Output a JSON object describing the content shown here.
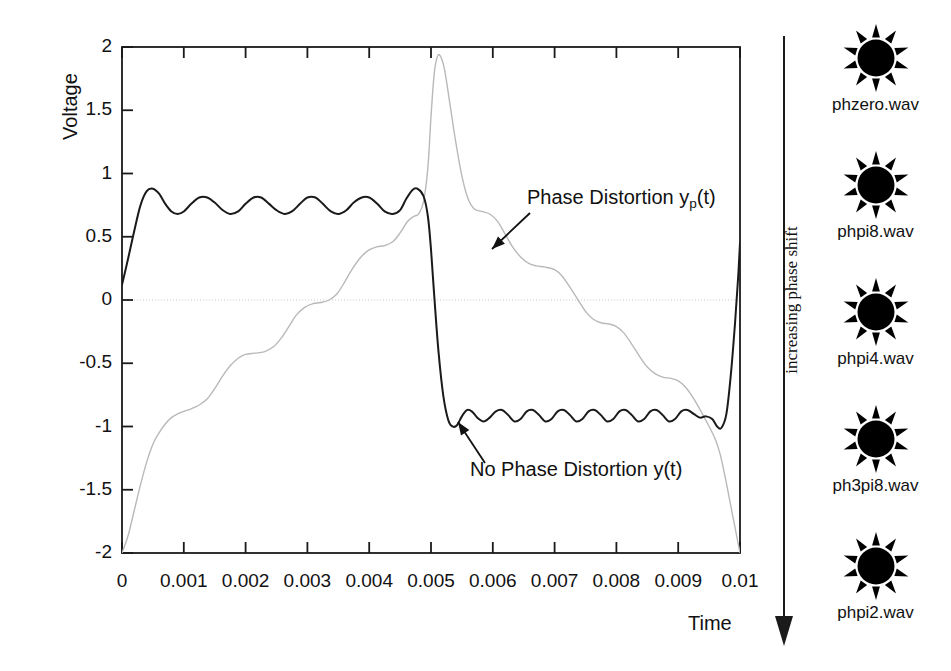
{
  "chart_data": {
    "type": "line",
    "title": "",
    "xlabel": "Time",
    "ylabel": "Voltage",
    "xlim": [
      0,
      0.01
    ],
    "ylim": [
      -2,
      2
    ],
    "xticks": [
      "0",
      "0.001",
      "0.002",
      "0.003",
      "0.004",
      "0.005",
      "0.006",
      "0.007",
      "0.008",
      "0.009",
      "0.01"
    ],
    "xtick_values": [
      0,
      0.001,
      0.002,
      0.003,
      0.004,
      0.005,
      0.006,
      0.007,
      0.008,
      0.009,
      0.01
    ],
    "yticks": [
      "2",
      "1.5",
      "1",
      "0.5",
      "0",
      "-0.5",
      "-1",
      "-1.5",
      "-2"
    ],
    "ytick_values": [
      2,
      1.5,
      1,
      0.5,
      0,
      -0.5,
      -1,
      -1.5,
      -2
    ],
    "grid": false,
    "zero_line": true,
    "legend_position": "inline-annotations",
    "series": [
      {
        "name": "No Phase Distortion y(t)",
        "color": "#1a1a1a",
        "style": "solid",
        "width": 2.0,
        "description": "Bandlimited square wave (Fourier partial sum) showing Gibbs ringing, amplitude approx +0.88 to -1.0, period 0.01 s",
        "points": [
          [
            0.0,
            0.12
          ],
          [
            0.0001,
            0.33
          ],
          [
            0.0002,
            0.55
          ],
          [
            0.0003,
            0.75
          ],
          [
            0.0004,
            0.86
          ],
          [
            0.0005,
            0.88
          ],
          [
            0.0006,
            0.84
          ],
          [
            0.0007,
            0.76
          ],
          [
            0.0008,
            0.7
          ],
          [
            0.0009,
            0.68
          ],
          [
            0.001,
            0.7
          ],
          [
            0.00112,
            0.76
          ],
          [
            0.00125,
            0.81
          ],
          [
            0.00138,
            0.81
          ],
          [
            0.0015,
            0.77
          ],
          [
            0.00163,
            0.71
          ],
          [
            0.00175,
            0.68
          ],
          [
            0.00188,
            0.7
          ],
          [
            0.002,
            0.76
          ],
          [
            0.00213,
            0.81
          ],
          [
            0.00225,
            0.81
          ],
          [
            0.00238,
            0.76
          ],
          [
            0.0025,
            0.71
          ],
          [
            0.00263,
            0.68
          ],
          [
            0.00275,
            0.7
          ],
          [
            0.00288,
            0.76
          ],
          [
            0.003,
            0.81
          ],
          [
            0.00313,
            0.81
          ],
          [
            0.00325,
            0.76
          ],
          [
            0.00338,
            0.7
          ],
          [
            0.0035,
            0.68
          ],
          [
            0.00363,
            0.71
          ],
          [
            0.00375,
            0.77
          ],
          [
            0.00388,
            0.81
          ],
          [
            0.004,
            0.81
          ],
          [
            0.00413,
            0.76
          ],
          [
            0.00425,
            0.7
          ],
          [
            0.00438,
            0.68
          ],
          [
            0.0045,
            0.71
          ],
          [
            0.0046,
            0.8
          ],
          [
            0.0047,
            0.87
          ],
          [
            0.00478,
            0.88
          ],
          [
            0.00488,
            0.82
          ],
          [
            0.00495,
            0.66
          ],
          [
            0.005,
            0.4
          ],
          [
            0.00505,
            0.05
          ],
          [
            0.00512,
            -0.4
          ],
          [
            0.0052,
            -0.76
          ],
          [
            0.00528,
            -0.95
          ],
          [
            0.00535,
            -1.0
          ],
          [
            0.00542,
            -0.99
          ],
          [
            0.0055,
            -0.92
          ],
          [
            0.00558,
            -0.87
          ],
          [
            0.00566,
            -0.88
          ],
          [
            0.00575,
            -0.93
          ],
          [
            0.00585,
            -0.96
          ],
          [
            0.00595,
            -0.93
          ],
          [
            0.00605,
            -0.88
          ],
          [
            0.00615,
            -0.87
          ],
          [
            0.00625,
            -0.91
          ],
          [
            0.00635,
            -0.96
          ],
          [
            0.00645,
            -0.94
          ],
          [
            0.00655,
            -0.88
          ],
          [
            0.00665,
            -0.87
          ],
          [
            0.00675,
            -0.91
          ],
          [
            0.00685,
            -0.96
          ],
          [
            0.00695,
            -0.94
          ],
          [
            0.00705,
            -0.88
          ],
          [
            0.00715,
            -0.87
          ],
          [
            0.00725,
            -0.91
          ],
          [
            0.00735,
            -0.96
          ],
          [
            0.00745,
            -0.94
          ],
          [
            0.00755,
            -0.88
          ],
          [
            0.00765,
            -0.87
          ],
          [
            0.00775,
            -0.91
          ],
          [
            0.00785,
            -0.96
          ],
          [
            0.00795,
            -0.94
          ],
          [
            0.00805,
            -0.88
          ],
          [
            0.00815,
            -0.87
          ],
          [
            0.00825,
            -0.91
          ],
          [
            0.00835,
            -0.96
          ],
          [
            0.00845,
            -0.94
          ],
          [
            0.00855,
            -0.88
          ],
          [
            0.00865,
            -0.87
          ],
          [
            0.00875,
            -0.91
          ],
          [
            0.00885,
            -0.96
          ],
          [
            0.00895,
            -0.94
          ],
          [
            0.00905,
            -0.88
          ],
          [
            0.00915,
            -0.87
          ],
          [
            0.00925,
            -0.9
          ],
          [
            0.00935,
            -0.93
          ],
          [
            0.00945,
            -0.92
          ],
          [
            0.00955,
            -0.94
          ],
          [
            0.00963,
            -1.0
          ],
          [
            0.0097,
            -1.01
          ],
          [
            0.00978,
            -0.9
          ],
          [
            0.00985,
            -0.6
          ],
          [
            0.00992,
            -0.18
          ],
          [
            0.00997,
            0.18
          ],
          [
            0.01,
            0.45
          ]
        ]
      },
      {
        "name": "Phase Distortion y_p(t)",
        "color": "#b9b9b9",
        "style": "solid",
        "width": 1.4,
        "description": "Same magnitude spectrum with progressive phase shift; staircase rise from -2 to peak 1.93 at t=0.005 then staircase decay back to -2",
        "points": [
          [
            0.0,
            -2.0
          ],
          [
            0.0001,
            -1.86
          ],
          [
            0.0002,
            -1.66
          ],
          [
            0.0003,
            -1.46
          ],
          [
            0.0004,
            -1.28
          ],
          [
            0.0005,
            -1.14
          ],
          [
            0.0006,
            -1.05
          ],
          [
            0.0007,
            -0.98
          ],
          [
            0.0008,
            -0.93
          ],
          [
            0.0009,
            -0.9
          ],
          [
            0.001,
            -0.88
          ],
          [
            0.00112,
            -0.86
          ],
          [
            0.00125,
            -0.83
          ],
          [
            0.00138,
            -0.78
          ],
          [
            0.0015,
            -0.7
          ],
          [
            0.00163,
            -0.6
          ],
          [
            0.00175,
            -0.52
          ],
          [
            0.00188,
            -0.46
          ],
          [
            0.002,
            -0.43
          ],
          [
            0.00215,
            -0.42
          ],
          [
            0.0023,
            -0.41
          ],
          [
            0.00245,
            -0.37
          ],
          [
            0.00258,
            -0.3
          ],
          [
            0.0027,
            -0.21
          ],
          [
            0.00282,
            -0.12
          ],
          [
            0.00295,
            -0.06
          ],
          [
            0.00308,
            -0.03
          ],
          [
            0.00322,
            -0.02
          ],
          [
            0.00335,
            0.0
          ],
          [
            0.00348,
            0.05
          ],
          [
            0.0036,
            0.14
          ],
          [
            0.00372,
            0.24
          ],
          [
            0.00385,
            0.33
          ],
          [
            0.00398,
            0.39
          ],
          [
            0.00412,
            0.42
          ],
          [
            0.00425,
            0.43
          ],
          [
            0.00438,
            0.46
          ],
          [
            0.0045,
            0.53
          ],
          [
            0.00462,
            0.62
          ],
          [
            0.00472,
            0.66
          ],
          [
            0.0048,
            0.68
          ],
          [
            0.00488,
            0.78
          ],
          [
            0.00495,
            1.05
          ],
          [
            0.005,
            1.45
          ],
          [
            0.00505,
            1.78
          ],
          [
            0.0051,
            1.92
          ],
          [
            0.00515,
            1.93
          ],
          [
            0.00522,
            1.82
          ],
          [
            0.0053,
            1.57
          ],
          [
            0.0054,
            1.25
          ],
          [
            0.0055,
            0.98
          ],
          [
            0.0056,
            0.8
          ],
          [
            0.0057,
            0.72
          ],
          [
            0.00582,
            0.7
          ],
          [
            0.00595,
            0.68
          ],
          [
            0.00608,
            0.62
          ],
          [
            0.0062,
            0.52
          ],
          [
            0.00632,
            0.42
          ],
          [
            0.00645,
            0.34
          ],
          [
            0.00658,
            0.29
          ],
          [
            0.0067,
            0.27
          ],
          [
            0.00685,
            0.26
          ],
          [
            0.007,
            0.24
          ],
          [
            0.00712,
            0.19
          ],
          [
            0.00725,
            0.1
          ],
          [
            0.00738,
            0.0
          ],
          [
            0.0075,
            -0.09
          ],
          [
            0.00762,
            -0.15
          ],
          [
            0.00775,
            -0.18
          ],
          [
            0.00788,
            -0.19
          ],
          [
            0.008,
            -0.21
          ],
          [
            0.00812,
            -0.26
          ],
          [
            0.00825,
            -0.35
          ],
          [
            0.00838,
            -0.45
          ],
          [
            0.0085,
            -0.53
          ],
          [
            0.00862,
            -0.58
          ],
          [
            0.00875,
            -0.61
          ],
          [
            0.00888,
            -0.62
          ],
          [
            0.009,
            -0.64
          ],
          [
            0.00912,
            -0.69
          ],
          [
            0.00925,
            -0.78
          ],
          [
            0.00938,
            -0.89
          ],
          [
            0.0095,
            -1.0
          ],
          [
            0.0096,
            -1.1
          ],
          [
            0.00968,
            -1.22
          ],
          [
            0.00976,
            -1.4
          ],
          [
            0.00984,
            -1.6
          ],
          [
            0.00992,
            -1.8
          ],
          [
            0.01,
            -2.0
          ]
        ]
      }
    ],
    "annotations": [
      {
        "id": "phase-distortion",
        "text_main": "Phase Distortion y",
        "text_sub": "p",
        "text_tail": "(t)",
        "label_x": 527,
        "label_y": 197,
        "arrow_from": [
          530,
          213
        ],
        "arrow_to": [
          492,
          249
        ]
      },
      {
        "id": "no-phase-distortion",
        "text_main": "No Phase Distortion y(t)",
        "text_sub": "",
        "text_tail": "",
        "label_x": 470,
        "label_y": 468,
        "arrow_from": [
          485,
          463
        ],
        "arrow_to": [
          458,
          422
        ]
      }
    ]
  },
  "phase_arrow": {
    "label": "increasing phase shift",
    "direction": "down"
  },
  "file_column": {
    "icon_name": "sound-burst-icon",
    "items": [
      {
        "label": "phzero.wav"
      },
      {
        "label": "phpi8.wav"
      },
      {
        "label": "phpi4.wav"
      },
      {
        "label": "ph3pi8.wav"
      },
      {
        "label": "phpi2.wav"
      }
    ]
  },
  "colors": {
    "axis": "#1a1a1a",
    "trace_solid": "#1a1a1a",
    "trace_distorted": "#b9b9b9",
    "zero_line": "#c9c9c9",
    "icon": "#000000",
    "background": "#ffffff"
  }
}
